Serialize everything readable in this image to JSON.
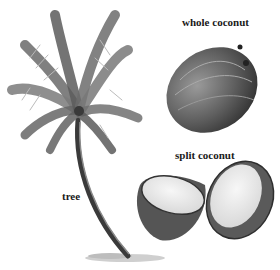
{
  "figure": {
    "labels": {
      "whole": "whole coconut",
      "split": "split coconut",
      "tree": "tree"
    },
    "colors": {
      "ink": "#1a1a1a",
      "dark_gray": "#444444",
      "mid_gray": "#777777",
      "light_gray": "#cfcfcf",
      "flesh": "#eeeeee"
    }
  }
}
